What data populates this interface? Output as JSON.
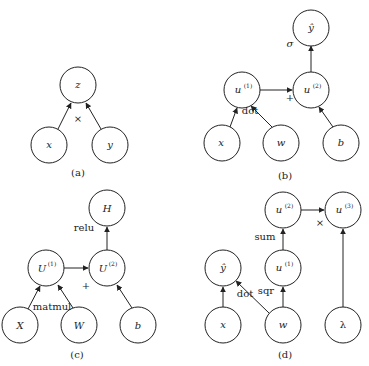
{
  "figure": {
    "panels": [
      {
        "id": "a",
        "caption": "(a)",
        "nodes": [
          {
            "id": "z",
            "label": "z"
          },
          {
            "id": "x",
            "label": "x"
          },
          {
            "id": "y",
            "label": "y"
          }
        ],
        "edges": [
          {
            "from": "x",
            "to": "z"
          },
          {
            "from": "y",
            "to": "z"
          }
        ],
        "op_labels": [
          {
            "text": "×"
          }
        ]
      },
      {
        "id": "b",
        "caption": "(b)",
        "nodes": [
          {
            "id": "yhat",
            "label": "ŷ"
          },
          {
            "id": "u1",
            "label": "u",
            "sup": "(1)"
          },
          {
            "id": "u2",
            "label": "u",
            "sup": "(2)"
          },
          {
            "id": "x",
            "label": "x"
          },
          {
            "id": "w",
            "label": "w"
          },
          {
            "id": "b",
            "label": "b"
          }
        ],
        "edges": [
          {
            "from": "x",
            "to": "u1"
          },
          {
            "from": "w",
            "to": "u1"
          },
          {
            "from": "u1",
            "to": "u2"
          },
          {
            "from": "b",
            "to": "u2"
          },
          {
            "from": "u2",
            "to": "yhat"
          }
        ],
        "op_labels": [
          {
            "text": "σ"
          },
          {
            "text": "+"
          },
          {
            "text": "dot"
          }
        ]
      },
      {
        "id": "c",
        "caption": "(c)",
        "nodes": [
          {
            "id": "H",
            "label": "H"
          },
          {
            "id": "U1",
            "label": "U",
            "sup": "(1)"
          },
          {
            "id": "U2",
            "label": "U",
            "sup": "(2)"
          },
          {
            "id": "X",
            "label": "X"
          },
          {
            "id": "W",
            "label": "W"
          },
          {
            "id": "b",
            "label": "b"
          }
        ],
        "edges": [
          {
            "from": "X",
            "to": "U1"
          },
          {
            "from": "W",
            "to": "U1"
          },
          {
            "from": "U1",
            "to": "U2"
          },
          {
            "from": "b",
            "to": "U2"
          },
          {
            "from": "U2",
            "to": "H"
          }
        ],
        "op_labels": [
          {
            "text": "relu"
          },
          {
            "text": "+"
          },
          {
            "text": "matmul"
          }
        ]
      },
      {
        "id": "d",
        "caption": "(d)",
        "nodes": [
          {
            "id": "u2",
            "label": "u",
            "sup": "(2)"
          },
          {
            "id": "u3",
            "label": "u",
            "sup": "(3)"
          },
          {
            "id": "yhat",
            "label": "ŷ"
          },
          {
            "id": "u1",
            "label": "u",
            "sup": "(1)"
          },
          {
            "id": "x",
            "label": "x"
          },
          {
            "id": "w",
            "label": "w"
          },
          {
            "id": "lambda",
            "label": "λ"
          }
        ],
        "edges": [
          {
            "from": "x",
            "to": "yhat"
          },
          {
            "from": "w",
            "to": "yhat"
          },
          {
            "from": "w",
            "to": "u1"
          },
          {
            "from": "u1",
            "to": "u2"
          },
          {
            "from": "u2",
            "to": "u3"
          },
          {
            "from": "lambda",
            "to": "u3"
          }
        ],
        "op_labels": [
          {
            "text": "sum"
          },
          {
            "text": "×"
          },
          {
            "text": "sqr"
          },
          {
            "text": "dot"
          }
        ]
      }
    ]
  }
}
